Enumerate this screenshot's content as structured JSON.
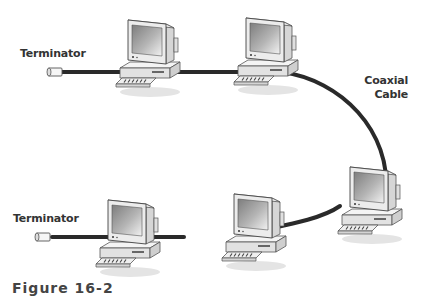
{
  "diagram": {
    "type": "bus-network-topology",
    "labels": {
      "terminator_top": "Terminator",
      "terminator_bottom": "Terminator",
      "coaxial_line1": "Coaxial",
      "coaxial_line2": "Cable"
    },
    "caption": "Figure 16-2",
    "nodes": [
      {
        "id": "pc1",
        "kind": "computer"
      },
      {
        "id": "pc2",
        "kind": "computer"
      },
      {
        "id": "pc3",
        "kind": "computer"
      },
      {
        "id": "pc4",
        "kind": "computer"
      },
      {
        "id": "pc5",
        "kind": "computer"
      }
    ],
    "terminators": [
      {
        "id": "term-top"
      },
      {
        "id": "term-bottom"
      }
    ],
    "colors": {
      "cable": "#2a2a2a",
      "monitor_body": "#e8e8e8",
      "screen": "#9a9a9a",
      "text": "#333333"
    }
  }
}
